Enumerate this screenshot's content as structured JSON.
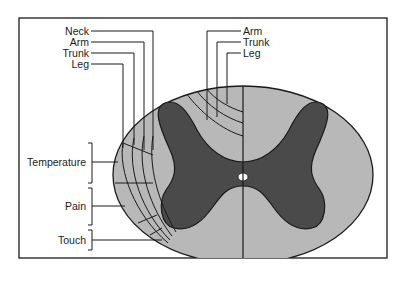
{
  "figure": {
    "colors": {
      "white_matter": "#b8b8b8",
      "gray_matter": "#4a4a4a",
      "outline": "#1a1a1a",
      "background": "#ffffff"
    }
  },
  "left_labels": {
    "neck": "Neck",
    "arm": "Arm",
    "trunk": "Trunk",
    "leg": "Leg"
  },
  "right_labels": {
    "arm": "Arm",
    "trunk": "Trunk",
    "leg": "Leg"
  },
  "modality_labels": {
    "temperature": "Temperature",
    "pain": "Pain",
    "touch": "Touch"
  }
}
